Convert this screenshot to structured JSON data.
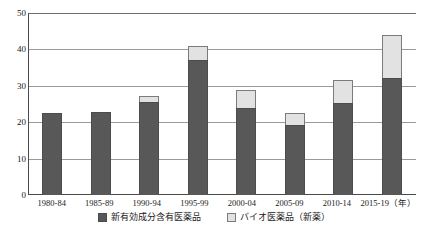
{
  "chart_data": {
    "type": "bar",
    "subtype": "stacked-column",
    "title": "",
    "xlabel": "(年)",
    "ylabel": "",
    "ylim": [
      0,
      50
    ],
    "yticks": [
      0,
      10,
      20,
      30,
      40,
      50
    ],
    "grid": true,
    "legend_position": "bottom-center",
    "categories": [
      "1980-84",
      "1985-89",
      "1990-94",
      "1995-99",
      "2000-04",
      "2005-09",
      "2010-14",
      "2015-19"
    ],
    "series": [
      {
        "name": "新有効成分含有医薬品",
        "color": "#585858",
        "values": [
          22.5,
          22.8,
          25.5,
          37.0,
          24.0,
          19.2,
          25.4,
          32.2
        ]
      },
      {
        "name": "バイオ医薬品（新薬）",
        "color": "#e2e2e2",
        "values": [
          0.0,
          0.0,
          1.8,
          4.0,
          4.8,
          3.3,
          6.2,
          11.8
        ]
      }
    ],
    "totals": [
      22.5,
      22.8,
      27.3,
      41.0,
      28.8,
      22.5,
      31.6,
      44.0
    ]
  },
  "axis": {
    "y_tick_labels": [
      "50",
      "40",
      "30",
      "20",
      "10",
      "0"
    ],
    "x_unit_label": "（年）"
  },
  "legend": {
    "items": [
      {
        "label": "新有効成分含有医薬品",
        "swatch": "dark-square-icon"
      },
      {
        "label": "バイオ医薬品（新薬）",
        "swatch": "light-square-icon"
      }
    ]
  },
  "colors": {
    "series_dark": "#585858",
    "series_light": "#e2e2e2",
    "axis": "#4a4a4a",
    "grid": "#9a9a9a",
    "text": "#1a1a1a",
    "background": "#ffffff"
  }
}
